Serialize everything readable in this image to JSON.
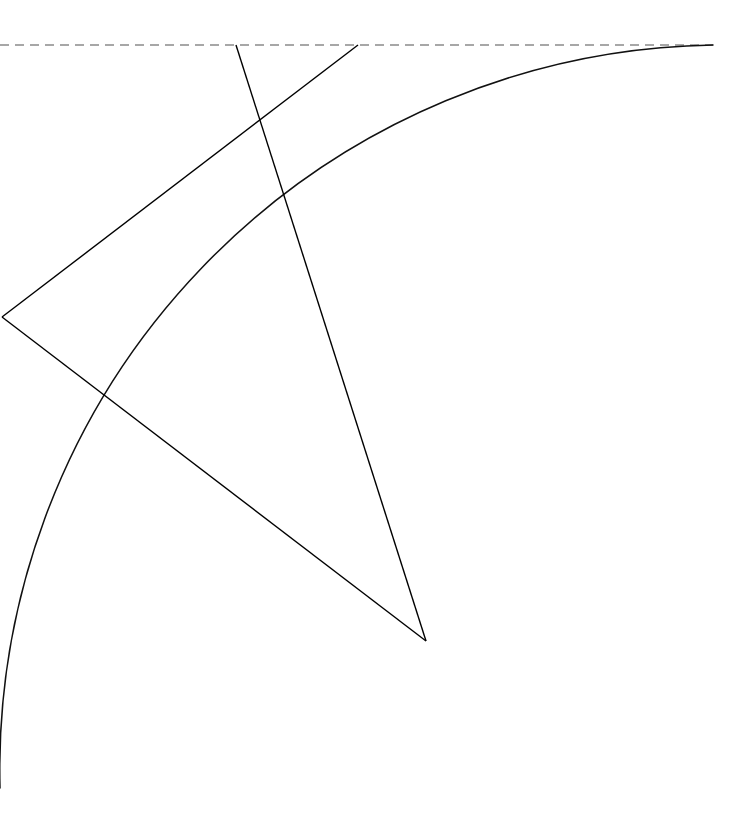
{
  "figure": {
    "canvas": {
      "width": 750,
      "height": 834,
      "background": "#ffffff"
    },
    "colors": {
      "solid_stroke": "#000000",
      "arc_stroke": "#111111",
      "dashed_stroke": "#8a8a8a"
    }
  },
  "geometry": {
    "circle": {
      "center_x": -12,
      "center_y": 63,
      "radius": 725,
      "description": "Center lies off-canvas beyond the upper-left corner"
    },
    "points": {
      "left_vertex": {
        "x": 2,
        "y": 317,
        "label": "left-vertex"
      },
      "bottom_vertex": {
        "x": 426,
        "y": 641,
        "label": "arc-vertex"
      },
      "top_left_node": {
        "x": 236,
        "y": 45,
        "label": "top-left-node"
      },
      "top_right_node": {
        "x": 358,
        "y": 45,
        "label": "top-right-node"
      },
      "arc_top_end": {
        "x": 713,
        "y": 45,
        "label": "arc-top-endpoint"
      },
      "arc_bottom_end": {
        "x": 0,
        "y": 788,
        "label": "arc-bottom-endpoint"
      },
      "crossing_point": {
        "x": 258,
        "y": 120,
        "label": "segment-crossing"
      }
    },
    "dashed_baseline": {
      "x1": 0,
      "y1": 45,
      "x2": 713,
      "y2": 45,
      "dash_pattern": "9 6"
    },
    "segments": [
      {
        "name": "segment-top-left-to-arc-vertex",
        "x1": 236,
        "y1": 45,
        "x2": 426,
        "y2": 641
      },
      {
        "name": "segment-top-right-to-left-vertex",
        "x1": 358,
        "y1": 45,
        "x2": 2,
        "y2": 317
      },
      {
        "name": "segment-left-vertex-to-arc-vertex",
        "x1": 2,
        "y1": 317,
        "x2": 426,
        "y2": 641
      }
    ],
    "arc": {
      "name": "circle-arc",
      "start_x": 713,
      "start_y": 45,
      "end_x": 0,
      "end_y": 788,
      "radius": 725,
      "large_arc_flag": 0,
      "sweep_flag": 0,
      "path": "M 713 45 A 725 725 0 0 0 0 788"
    }
  }
}
